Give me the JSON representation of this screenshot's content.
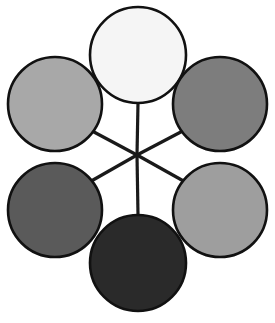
{
  "diagram": {
    "name": "radial-hub-and-spoke-diagram",
    "type": "radial",
    "canvas": {
      "width": 275,
      "height": 323,
      "background": "#ffffff"
    },
    "hub": {
      "label": "",
      "cx": 137,
      "cy": 155,
      "visible_marker": false
    },
    "style": {
      "node_stroke_color": "#111111",
      "node_stroke_width": 2.6,
      "spoke_stroke_color": "#1a1a1a",
      "spoke_stroke_width": 3.2
    },
    "nodes": [
      {
        "id": "node-top",
        "label": "",
        "position": "top",
        "cx": 138,
        "cy": 55,
        "r": 48,
        "fill": "#f5f5f5",
        "shade_name": "near-white"
      },
      {
        "id": "node-top-left",
        "label": "",
        "position": "top-left",
        "cx": 55,
        "cy": 104,
        "r": 47,
        "fill": "#a8a8a8",
        "shade_name": "light-medium-gray"
      },
      {
        "id": "node-top-right",
        "label": "",
        "position": "top-right",
        "cx": 220,
        "cy": 104,
        "r": 47,
        "fill": "#7d7d7d",
        "shade_name": "medium-gray"
      },
      {
        "id": "node-bottom-left",
        "label": "",
        "position": "bottom-left",
        "cx": 55,
        "cy": 210,
        "r": 47,
        "fill": "#5a5a5a",
        "shade_name": "dark-medium-gray"
      },
      {
        "id": "node-bottom-right",
        "label": "",
        "position": "bottom-right",
        "cx": 220,
        "cy": 210,
        "r": 47,
        "fill": "#9e9e9e",
        "shade_name": "light-gray"
      },
      {
        "id": "node-bottom",
        "label": "",
        "position": "bottom",
        "cx": 138,
        "cy": 263,
        "r": 48,
        "fill": "#2a2a2a",
        "shade_name": "near-black"
      }
    ],
    "spokes": [
      {
        "id": "spoke-to-top",
        "from": "hub",
        "to": "node-top",
        "x1": 137,
        "y1": 155,
        "x2": 138,
        "y2": 103
      },
      {
        "id": "spoke-to-top-left",
        "from": "hub",
        "to": "node-top-left",
        "x1": 137,
        "y1": 155,
        "x2": 79,
        "y2": 124
      },
      {
        "id": "spoke-to-top-right",
        "from": "hub",
        "to": "node-top-right",
        "x1": 137,
        "y1": 155,
        "x2": 196,
        "y2": 124
      },
      {
        "id": "spoke-to-bottom-left",
        "from": "hub",
        "to": "node-bottom-left",
        "x1": 137,
        "y1": 155,
        "x2": 79,
        "y2": 188
      },
      {
        "id": "spoke-to-bottom-right",
        "from": "hub",
        "to": "node-bottom-right",
        "x1": 137,
        "y1": 155,
        "x2": 196,
        "y2": 188
      },
      {
        "id": "spoke-to-bottom",
        "from": "hub",
        "to": "node-bottom",
        "x1": 137,
        "y1": 155,
        "x2": 138,
        "y2": 215
      }
    ]
  }
}
